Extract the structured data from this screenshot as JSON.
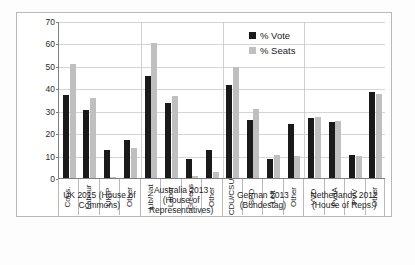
{
  "chart_data": {
    "type": "bar",
    "title": "",
    "xlabel": "",
    "ylabel": "",
    "ylim": [
      0,
      70
    ],
    "yticks": [
      0,
      10,
      20,
      30,
      40,
      50,
      60,
      70
    ],
    "grid": true,
    "legend_position": "top-right",
    "categories": [
      "Cons.",
      "Labour",
      "UKIP",
      "Other",
      "Lib/Nat",
      "Labor",
      "Greens",
      "Other",
      "CDU/CSU",
      "SPD",
      "Left",
      "Other",
      "VVD",
      "PvdA",
      "PVV",
      "Other"
    ],
    "series": [
      {
        "name": "% Vote",
        "color": "#1a1a1a",
        "values": [
          36.9,
          30.4,
          12.6,
          17.1,
          45.6,
          33.4,
          8.7,
          12.3,
          41.5,
          25.7,
          8.6,
          24.2,
          26.6,
          24.8,
          10.1,
          38.5
        ]
      },
      {
        "name": "% Seats",
        "color": "#bfbfbf",
        "values": [
          50.8,
          35.7,
          0.2,
          13.3,
          60.0,
          36.7,
          0.7,
          2.6,
          49.3,
          30.6,
          10.4,
          9.7,
          27.3,
          25.3,
          10.0,
          37.4
        ]
      }
    ],
    "groups": [
      {
        "label": "UK 2015 (House of Commons)",
        "start": 0,
        "count": 4
      },
      {
        "label": "Australia 2013 (House of Representatives)",
        "start": 4,
        "count": 4
      },
      {
        "label": "German 2013 (Bundestag)",
        "start": 8,
        "count": 4
      },
      {
        "label": "Netherlands 2012 (House of Reps.)",
        "start": 12,
        "count": 4
      }
    ]
  },
  "legend": {
    "items": [
      {
        "label": "% Vote",
        "swatch": "vote-swatch"
      },
      {
        "label": "% Seats",
        "swatch": "seats-swatch"
      }
    ]
  }
}
